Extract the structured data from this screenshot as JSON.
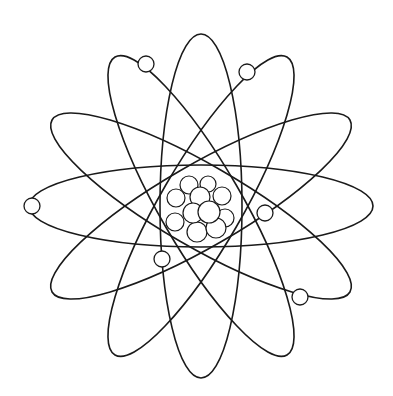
{
  "figure": {
    "background": "#ffffff",
    "stroke_color": "#1a1a1a",
    "center": [
      201,
      206
    ],
    "orbit": {
      "rx": 172,
      "ry": 41,
      "angles_deg": [
        0,
        30,
        60,
        90,
        120,
        150
      ]
    },
    "electrons": [
      {
        "x": 146,
        "y": 64,
        "r": 8
      },
      {
        "x": 247,
        "y": 72,
        "r": 8
      },
      {
        "x": 32,
        "y": 206,
        "r": 8
      },
      {
        "x": 265,
        "y": 213,
        "r": 8
      },
      {
        "x": 162,
        "y": 259,
        "r": 8
      },
      {
        "x": 300,
        "y": 297,
        "r": 8
      }
    ],
    "nucleus": [
      {
        "x": 189,
        "y": 185,
        "r": 9
      },
      {
        "x": 208,
        "y": 184,
        "r": 8
      },
      {
        "x": 222,
        "y": 196,
        "r": 9
      },
      {
        "x": 176,
        "y": 198,
        "r": 9
      },
      {
        "x": 200,
        "y": 197,
        "r": 10
      },
      {
        "x": 175,
        "y": 222,
        "r": 9
      },
      {
        "x": 225,
        "y": 218,
        "r": 9
      },
      {
        "x": 197,
        "y": 232,
        "r": 10
      },
      {
        "x": 216,
        "y": 228,
        "r": 10
      },
      {
        "x": 193,
        "y": 213,
        "r": 10
      },
      {
        "x": 209,
        "y": 212,
        "r": 11
      }
    ]
  }
}
